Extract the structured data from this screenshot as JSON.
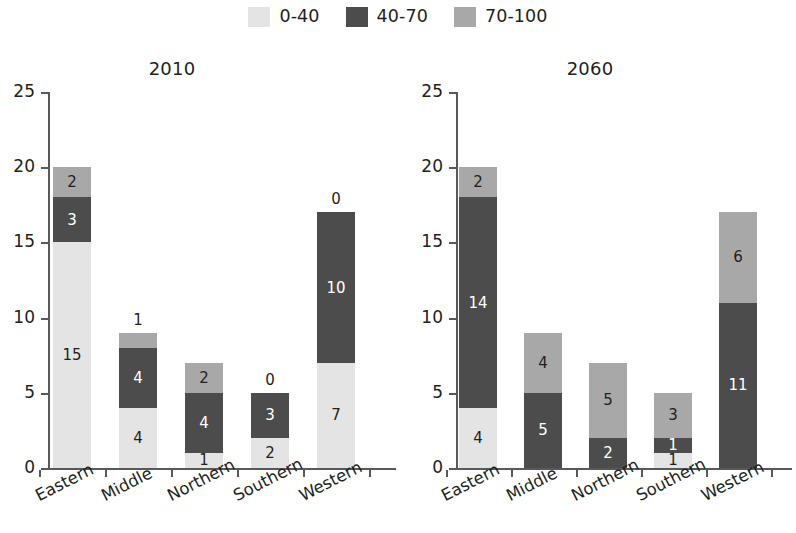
{
  "legend": {
    "items": [
      {
        "label": "0-40",
        "color": "#e4e4e4"
      },
      {
        "label": "40-70",
        "color": "#4c4c4c"
      },
      {
        "label": "70-100",
        "color": "#a8a8a8"
      }
    ]
  },
  "axis": {
    "y_ticks": [
      "0",
      "5",
      "10",
      "15",
      "20",
      "25"
    ],
    "categories": [
      "Eastern",
      "Middle",
      "Northern",
      "Southern",
      "Western"
    ]
  },
  "panels": [
    {
      "id": "2010",
      "title": "2010",
      "bars": [
        {
          "category": "Eastern",
          "segments": [
            {
              "series": "0-40",
              "value": 15,
              "label": "15",
              "label_pos": "inside",
              "label_color": "dark"
            },
            {
              "series": "40-70",
              "value": 3,
              "label": "3",
              "label_pos": "inside",
              "label_color": "light"
            },
            {
              "series": "70-100",
              "value": 2,
              "label": "2",
              "label_pos": "inside",
              "label_color": "dark"
            }
          ]
        },
        {
          "category": "Middle",
          "segments": [
            {
              "series": "0-40",
              "value": 4,
              "label": "4",
              "label_pos": "inside",
              "label_color": "dark"
            },
            {
              "series": "40-70",
              "value": 4,
              "label": "4",
              "label_pos": "inside",
              "label_color": "light"
            },
            {
              "series": "70-100",
              "value": 1,
              "label": "1",
              "label_pos": "above",
              "label_color": "dark"
            }
          ]
        },
        {
          "category": "Northern",
          "segments": [
            {
              "series": "0-40",
              "value": 1,
              "label": "1",
              "label_pos": "inside",
              "label_color": "dark"
            },
            {
              "series": "40-70",
              "value": 4,
              "label": "4",
              "label_pos": "inside",
              "label_color": "light"
            },
            {
              "series": "70-100",
              "value": 2,
              "label": "2",
              "label_pos": "inside",
              "label_color": "dark"
            }
          ]
        },
        {
          "category": "Southern",
          "segments": [
            {
              "series": "0-40",
              "value": 2,
              "label": "2",
              "label_pos": "inside",
              "label_color": "dark"
            },
            {
              "series": "40-70",
              "value": 3,
              "label": "3",
              "label_pos": "inside",
              "label_color": "light"
            },
            {
              "series": "70-100",
              "value": 0,
              "label": "0",
              "label_pos": "above",
              "label_color": "dark"
            }
          ]
        },
        {
          "category": "Western",
          "segments": [
            {
              "series": "0-40",
              "value": 7,
              "label": "7",
              "label_pos": "inside",
              "label_color": "dark"
            },
            {
              "series": "40-70",
              "value": 10,
              "label": "10",
              "label_pos": "inside",
              "label_color": "light"
            },
            {
              "series": "70-100",
              "value": 0,
              "label": "0",
              "label_pos": "above",
              "label_color": "dark"
            }
          ]
        }
      ]
    },
    {
      "id": "2060",
      "title": "2060",
      "bars": [
        {
          "category": "Eastern",
          "segments": [
            {
              "series": "0-40",
              "value": 4,
              "label": "4",
              "label_pos": "inside",
              "label_color": "dark"
            },
            {
              "series": "40-70",
              "value": 14,
              "label": "14",
              "label_pos": "inside",
              "label_color": "light"
            },
            {
              "series": "70-100",
              "value": 2,
              "label": "2",
              "label_pos": "inside",
              "label_color": "dark"
            }
          ]
        },
        {
          "category": "Middle",
          "segments": [
            {
              "series": "0-40",
              "value": 0,
              "label": "0",
              "label_pos": "below",
              "label_color": "dark"
            },
            {
              "series": "40-70",
              "value": 5,
              "label": "5",
              "label_pos": "inside",
              "label_color": "light"
            },
            {
              "series": "70-100",
              "value": 4,
              "label": "4",
              "label_pos": "inside",
              "label_color": "dark"
            }
          ]
        },
        {
          "category": "Northern",
          "segments": [
            {
              "series": "0-40",
              "value": 0,
              "label": "0",
              "label_pos": "below",
              "label_color": "dark"
            },
            {
              "series": "40-70",
              "value": 2,
              "label": "2",
              "label_pos": "inside",
              "label_color": "light"
            },
            {
              "series": "70-100",
              "value": 5,
              "label": "5",
              "label_pos": "inside",
              "label_color": "dark"
            }
          ]
        },
        {
          "category": "Southern",
          "segments": [
            {
              "series": "0-40",
              "value": 1,
              "label": "1",
              "label_pos": "inside",
              "label_color": "dark"
            },
            {
              "series": "40-70",
              "value": 1,
              "label": "1",
              "label_pos": "inside",
              "label_color": "light"
            },
            {
              "series": "70-100",
              "value": 3,
              "label": "3",
              "label_pos": "inside",
              "label_color": "dark"
            }
          ]
        },
        {
          "category": "Western",
          "segments": [
            {
              "series": "0-40",
              "value": 0,
              "label": "0",
              "label_pos": "below",
              "label_color": "dark"
            },
            {
              "series": "40-70",
              "value": 11,
              "label": "11",
              "label_pos": "inside",
              "label_color": "light"
            },
            {
              "series": "70-100",
              "value": 6,
              "label": "6",
              "label_pos": "inside",
              "label_color": "dark"
            }
          ]
        }
      ]
    }
  ],
  "chart_data": {
    "type": "bar",
    "title": "",
    "subtitle": "",
    "stacked": true,
    "xlabel": "",
    "ylabel": "",
    "ylim": [
      0,
      25
    ],
    "ytick_step": 5,
    "grid": false,
    "legend_position": "top-center",
    "legend_entries": [
      "0-40",
      "40-70",
      "70-100"
    ],
    "categories": [
      "Eastern",
      "Middle",
      "Northern",
      "Southern",
      "Western"
    ],
    "panels": [
      {
        "name": "2010",
        "series": [
          {
            "name": "0-40",
            "values": [
              15,
              4,
              1,
              2,
              7
            ]
          },
          {
            "name": "40-70",
            "values": [
              3,
              4,
              4,
              3,
              10
            ]
          },
          {
            "name": "70-100",
            "values": [
              2,
              1,
              2,
              0,
              0
            ]
          }
        ],
        "totals": [
          20,
          9,
          7,
          5,
          17
        ]
      },
      {
        "name": "2060",
        "series": [
          {
            "name": "0-40",
            "values": [
              4,
              0,
              0,
              1,
              0
            ]
          },
          {
            "name": "40-70",
            "values": [
              14,
              5,
              2,
              1,
              11
            ]
          },
          {
            "name": "70-100",
            "values": [
              2,
              4,
              5,
              3,
              6
            ]
          }
        ],
        "totals": [
          20,
          9,
          7,
          5,
          17
        ]
      }
    ]
  }
}
